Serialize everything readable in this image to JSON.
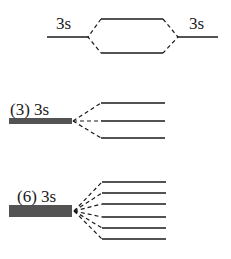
{
  "diagram": {
    "type": "molecular-orbital-splitting",
    "panels": [
      {
        "name": "dimer",
        "left_label": "3s",
        "right_label": "3s",
        "atomic_levels": 2,
        "molecular_levels": 2
      },
      {
        "name": "trimer",
        "label": "(3) 3s",
        "degenerate_count": 3,
        "split_levels": 3
      },
      {
        "name": "hexamer",
        "label": "(6) 3s",
        "degenerate_count": 6,
        "split_levels": 6
      }
    ]
  }
}
